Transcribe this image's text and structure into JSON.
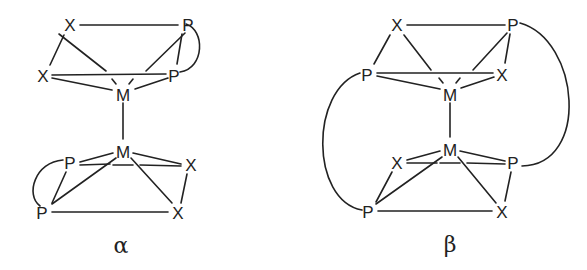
{
  "diagrams": [
    {
      "id": "alpha",
      "label": "α",
      "atoms": {
        "x_top": "X",
        "p_top": "P",
        "x_mid": "X",
        "p_mid": "P",
        "m_upper": "M",
        "m_lower": "M",
        "p_low_mid": "P",
        "x_low_mid": "X",
        "p_bottom": "P",
        "x_bottom": "X"
      }
    },
    {
      "id": "beta",
      "label": "β",
      "atoms": {
        "x_top": "X",
        "p_top": "P",
        "p_mid": "P",
        "x_mid": "X",
        "m_upper": "M",
        "m_lower": "M",
        "x_low_mid": "X",
        "p_low_mid": "P",
        "p_bottom": "P",
        "x_bottom": "X"
      }
    }
  ]
}
